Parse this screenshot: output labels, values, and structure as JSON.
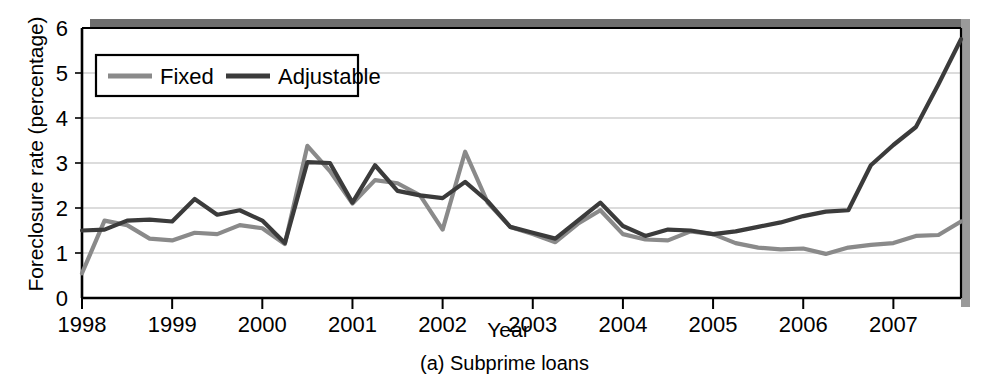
{
  "figure": {
    "caption": "(a) Subprime loans",
    "caption_prefix": "(a)",
    "caption_body": "Subprime loans"
  },
  "colors": {
    "fixed_line": "#8a8a8a",
    "adjustable_line": "#3b3b3b",
    "grid": "#b9b9b9",
    "axis": "#000000",
    "shadow_top": "#6e6e6e",
    "shadow_right": "#9a9a9a",
    "background": "#ffffff"
  },
  "chart_data": {
    "type": "line",
    "title": "",
    "subtitle": "",
    "xlabel": "Year",
    "ylabel": "Foreclosure rate (percentage)",
    "xlim": [
      1998.0,
      2007.75
    ],
    "ylim": [
      0,
      6
    ],
    "ytick_labels": [
      "0",
      "1",
      "2",
      "3",
      "4",
      "5",
      "6"
    ],
    "yticks": [
      0,
      1,
      2,
      3,
      4,
      5,
      6
    ],
    "xtick_labels": [
      "1998",
      "1999",
      "2000",
      "2001",
      "2002",
      "2003",
      "2004",
      "2005",
      "2006",
      "2007"
    ],
    "xticks": [
      1998,
      1999,
      2000,
      2001,
      2002,
      2003,
      2004,
      2005,
      2006,
      2007
    ],
    "grid": "horizontal",
    "legend_position": "upper-left-inside",
    "legend_entries": [
      "Fixed",
      "Adjustable"
    ],
    "x": [
      1998.0,
      1998.25,
      1998.5,
      1998.75,
      1999.0,
      1999.25,
      1999.5,
      1999.75,
      2000.0,
      2000.25,
      2000.5,
      2000.75,
      2001.0,
      2001.25,
      2001.5,
      2001.75,
      2002.0,
      2002.25,
      2002.5,
      2002.75,
      2003.0,
      2003.25,
      2003.5,
      2003.75,
      2004.0,
      2004.25,
      2004.5,
      2004.75,
      2005.0,
      2005.25,
      2005.5,
      2005.75,
      2006.0,
      2006.25,
      2006.5,
      2006.75,
      2007.0,
      2007.25,
      2007.5,
      2007.75
    ],
    "series": [
      {
        "name": "Fixed",
        "color": "#8a8a8a",
        "values": [
          0.55,
          1.72,
          1.62,
          1.32,
          1.28,
          1.45,
          1.42,
          1.62,
          1.55,
          1.2,
          3.38,
          2.82,
          2.1,
          2.62,
          2.55,
          2.28,
          1.52,
          3.25,
          2.12,
          1.58,
          1.42,
          1.24,
          1.65,
          1.95,
          1.42,
          1.3,
          1.28,
          1.48,
          1.42,
          1.22,
          1.12,
          1.08,
          1.1,
          0.98,
          1.12,
          1.18,
          1.22,
          1.38,
          1.4,
          1.7
        ]
      },
      {
        "name": "Adjustable",
        "color": "#3b3b3b",
        "values": [
          1.5,
          1.52,
          1.72,
          1.74,
          1.7,
          2.2,
          1.85,
          1.95,
          1.72,
          1.22,
          3.02,
          3.0,
          2.12,
          2.95,
          2.38,
          2.28,
          2.22,
          2.58,
          2.15,
          1.58,
          1.45,
          1.32,
          1.72,
          2.12,
          1.6,
          1.38,
          1.52,
          1.5,
          1.42,
          1.48,
          1.58,
          1.68,
          1.82,
          1.92,
          1.95,
          2.95,
          3.4,
          3.8,
          4.75,
          5.75
        ]
      }
    ]
  }
}
